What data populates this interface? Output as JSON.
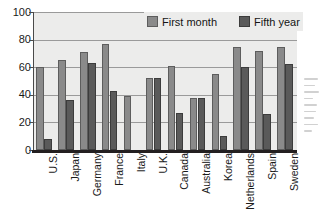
{
  "chart_data": {
    "type": "bar",
    "title": "",
    "xlabel": "",
    "ylabel": "",
    "ylim": [
      0,
      100
    ],
    "yticks": [
      0,
      20,
      40,
      60,
      80,
      100
    ],
    "ytick_labels": [
      "0",
      "20",
      "40",
      "60",
      "80",
      "100"
    ],
    "grid": true,
    "legend_position": "top-center-inside",
    "categories": [
      "U.S.",
      "Japan",
      "Germany",
      "France",
      "Italy",
      "U.K.",
      "Canada",
      "Australia",
      "Korea",
      "Netherlands",
      "Spain",
      "Sweden"
    ],
    "series": [
      {
        "name": "First month",
        "color": "#8a8a8a",
        "values": [
          60,
          65,
          71,
          77,
          39,
          52,
          61,
          38,
          55,
          75,
          72,
          75
        ]
      },
      {
        "name": "Fifth year",
        "color": "#5a5a5a",
        "values": [
          8,
          36,
          63,
          43,
          null,
          52,
          27,
          38,
          10,
          60,
          26,
          62
        ]
      }
    ]
  },
  "legend": {
    "entries": [
      {
        "label": "First month",
        "swatch": "first"
      },
      {
        "label": "Fifth year",
        "swatch": "fifth"
      }
    ]
  },
  "colors": {
    "plot_background": "#ececeb",
    "gridline": "#9a9a9a",
    "axis": "#231f20",
    "first_month": "#8a8a8a",
    "fifth_year": "#5a5a5a",
    "text": "#1a1a1a"
  }
}
